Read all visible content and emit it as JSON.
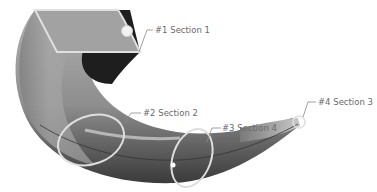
{
  "figure": {
    "colors": {
      "background": "#ffffff",
      "body_light": "#b8b8b8",
      "body_mid": "#8c8c8c",
      "body_dark": "#3c3c3c",
      "end_cap_top": "#a0a0a0",
      "inner_shadow": "#1e1e1e",
      "section_outline": "#dcdcdc",
      "leader_line": "#8a8a8a",
      "label_text": "#6a6a6a"
    }
  },
  "sections": [
    {
      "id": 1,
      "label": "#1 Section 1"
    },
    {
      "id": 2,
      "label": "#2 Section 2"
    },
    {
      "id": 3,
      "label": "#3 Section 4"
    },
    {
      "id": 4,
      "label": "#4 Section 3"
    }
  ]
}
